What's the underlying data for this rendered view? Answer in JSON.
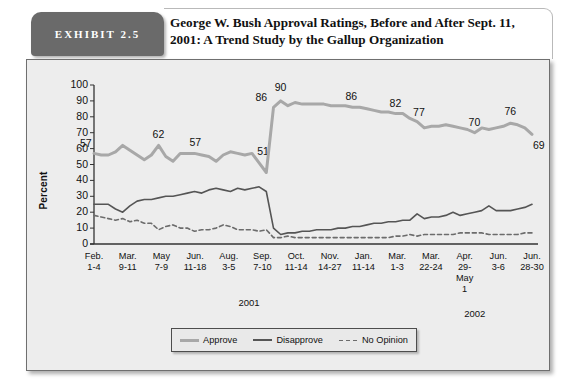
{
  "exhibit": {
    "tag": "EXHIBIT 2.5"
  },
  "header": {
    "title": "George W. Bush Approval Ratings, Before and After Sept. 11, 2001: A Trend Study by the Gallup Organization"
  },
  "chart_data": {
    "type": "line",
    "title": "George W. Bush Approval Ratings, Before and After Sept. 11, 2001: A Trend Study by the Gallup Organization",
    "xlabel": "",
    "ylabel": "Percent",
    "ylim": [
      0,
      100
    ],
    "ytick_values": [
      0,
      10,
      20,
      30,
      40,
      50,
      60,
      70,
      80,
      90,
      100
    ],
    "grid": false,
    "legend_position": "bottom-center",
    "x_major_labels": [
      {
        "month": "Feb.",
        "days": "1-4"
      },
      {
        "month": "Mar.",
        "days": "9-11"
      },
      {
        "month": "May",
        "days": "7-9"
      },
      {
        "month": "Jun.",
        "days": "11-18"
      },
      {
        "month": "Aug.",
        "days": "3-5"
      },
      {
        "month": "Sep.",
        "days": "7-10"
      },
      {
        "month": "Oct.",
        "days": "11-14"
      },
      {
        "month": "Nov.",
        "days": "14-27"
      },
      {
        "month": "Jan.",
        "days": "11-14"
      },
      {
        "month": "Mar.",
        "days": "1-3"
      },
      {
        "month": "Mar.",
        "days": "22-24"
      },
      {
        "month": "Apr.",
        "days": "29-",
        "days2": "May",
        "days3": "1"
      },
      {
        "month": "Jun.",
        "days": "3-6"
      },
      {
        "month": "Jun.",
        "days": "28-30"
      }
    ],
    "year_markers": [
      {
        "label": "2001"
      },
      {
        "label": "2002"
      }
    ],
    "series": [
      {
        "name": "Approve",
        "color": "#a8a8a8",
        "style": "solid",
        "values": [
          57,
          56,
          56,
          58,
          62,
          59,
          56,
          53,
          56,
          62,
          55,
          52,
          57,
          57,
          57,
          56,
          55,
          52,
          56,
          58,
          57,
          56,
          57,
          51,
          45,
          86,
          90,
          87,
          89,
          88,
          88,
          88,
          88,
          87,
          87,
          87,
          86,
          86,
          85,
          84,
          83,
          83,
          82,
          82,
          79,
          77,
          73,
          74,
          74,
          75,
          74,
          73,
          72,
          70,
          73,
          72,
          73,
          74,
          76,
          75,
          73,
          69
        ]
      },
      {
        "name": "Disapprove",
        "color": "#555555",
        "style": "solid",
        "values": [
          25,
          25,
          25,
          22,
          20,
          24,
          27,
          28,
          28,
          29,
          30,
          30,
          31,
          32,
          33,
          32,
          34,
          35,
          34,
          33,
          35,
          34,
          35,
          36,
          33,
          10,
          6,
          7,
          7,
          8,
          8,
          9,
          9,
          9,
          10,
          10,
          11,
          11,
          12,
          13,
          13,
          14,
          14,
          15,
          15,
          19,
          16,
          17,
          17,
          18,
          20,
          18,
          19,
          20,
          21,
          24,
          21,
          21,
          21,
          22,
          23,
          25
        ]
      },
      {
        "name": "No Opinion",
        "color": "#6c6c6c",
        "style": "dashed",
        "values": [
          18,
          17,
          16,
          15,
          16,
          14,
          15,
          13,
          13,
          9,
          11,
          12,
          10,
          10,
          8,
          9,
          9,
          10,
          12,
          11,
          9,
          9,
          9,
          8,
          9,
          4,
          4,
          5,
          4,
          4,
          4,
          4,
          4,
          4,
          4,
          4,
          4,
          4,
          4,
          4,
          4,
          4,
          5,
          5,
          6,
          5,
          6,
          6,
          6,
          6,
          6,
          7,
          7,
          7,
          7,
          6,
          6,
          6,
          6,
          6,
          7,
          7
        ]
      }
    ],
    "annotations": [
      {
        "text": "57",
        "value": 57,
        "series": "Approve"
      },
      {
        "text": "62",
        "value": 62,
        "series": "Approve"
      },
      {
        "text": "57",
        "value": 57,
        "series": "Approve"
      },
      {
        "text": "51",
        "value": 51,
        "series": "Approve"
      },
      {
        "text": "86",
        "value": 86,
        "series": "Approve"
      },
      {
        "text": "90",
        "value": 90,
        "series": "Approve"
      },
      {
        "text": "86",
        "value": 86,
        "series": "Approve"
      },
      {
        "text": "82",
        "value": 82,
        "series": "Approve"
      },
      {
        "text": "77",
        "value": 77,
        "series": "Approve"
      },
      {
        "text": "70",
        "value": 70,
        "series": "Approve"
      },
      {
        "text": "76",
        "value": 76,
        "series": "Approve"
      },
      {
        "text": "69",
        "value": 69,
        "series": "Approve"
      }
    ]
  },
  "axis": {
    "y_label": "Percent",
    "y_ticks": [
      "100",
      "90",
      "80",
      "70",
      "60",
      "50",
      "40",
      "30",
      "20",
      "10",
      "0"
    ]
  },
  "legend": {
    "items": [
      {
        "label": "Approve"
      },
      {
        "label": "Disapprove"
      },
      {
        "label": "No Opinion"
      }
    ]
  }
}
